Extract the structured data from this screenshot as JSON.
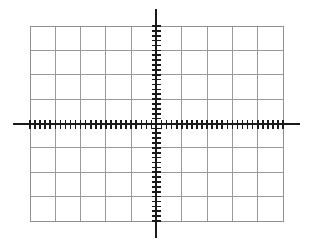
{
  "figure": {
    "kind": "oscilloscope-graticule",
    "background_color": "#ffffff",
    "width": 311,
    "height": 242
  },
  "chart_data": {
    "type": "scatter",
    "title": "",
    "subtitle": "",
    "xlabel": "",
    "ylabel": "",
    "series": [],
    "x": [],
    "values": [],
    "categories": [],
    "annotations": [],
    "legend": {
      "entries": [],
      "position": "none"
    },
    "grid": {
      "visible": true,
      "columns": 10,
      "rows": 8,
      "line_color": "#9a9a9a",
      "line_width": 1,
      "border_color": "#8f8f8f",
      "border_width": 1,
      "left": 30,
      "top": 26,
      "right": 283,
      "bottom": 221,
      "cell_width": 25.3,
      "cell_height": 24.375
    },
    "axes": {
      "x_axis": {
        "label": "",
        "center_y": 124,
        "start_x": 13,
        "end_x": 300,
        "color": "#1a1a1a",
        "line_width": 2,
        "tick_count": 51,
        "tick_spacing": 5.06,
        "tick_length": 9,
        "tick_width": 1.6,
        "tick_color": "#1a1a1a",
        "tick_range": [
          30,
          283
        ]
      },
      "y_axis": {
        "label": "",
        "center_x": 156,
        "start_y": 9,
        "end_y": 238,
        "color": "#1a1a1a",
        "line_width": 2,
        "tick_count": 41,
        "tick_spacing": 4.875,
        "tick_length": 9,
        "tick_width": 1.6,
        "tick_color": "#1a1a1a",
        "tick_range": [
          26,
          221
        ]
      },
      "xlim": [
        -5,
        5
      ],
      "ylim": [
        -4,
        4
      ],
      "major_divisions_x": 10,
      "major_divisions_y": 8,
      "minor_per_major_x": 5,
      "minor_per_major_y": 5
    }
  }
}
